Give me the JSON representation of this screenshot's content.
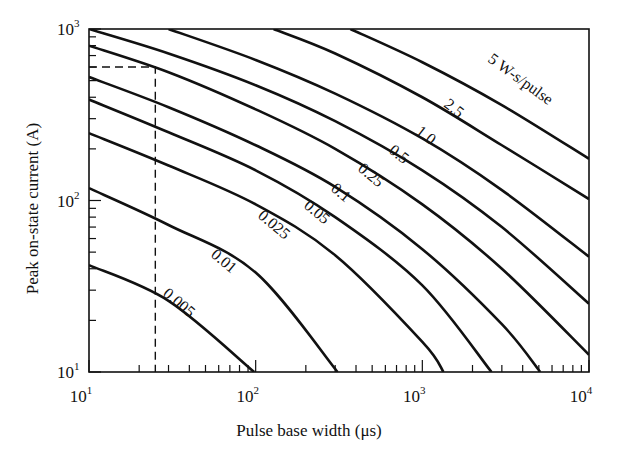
{
  "chart_data": {
    "type": "line",
    "title": "",
    "xlabel": "Pulse base width (μs)",
    "ylabel": "Peak on-state current (A)",
    "xscale": "log",
    "yscale": "log",
    "xlim": [
      10,
      10000
    ],
    "ylim": [
      10,
      1000
    ],
    "grid": false,
    "legend": "inline curve labels",
    "x_ticks": [
      {
        "value": 10,
        "label_base": "10",
        "label_exp": "1"
      },
      {
        "value": 100,
        "label_base": "10",
        "label_exp": "2"
      },
      {
        "value": 1000,
        "label_base": "10",
        "label_exp": "3"
      },
      {
        "value": 10000,
        "label_base": "10",
        "label_exp": "4"
      }
    ],
    "y_ticks": [
      {
        "value": 10,
        "label_base": "10",
        "label_exp": "1"
      },
      {
        "value": 100,
        "label_base": "10",
        "label_exp": "2"
      },
      {
        "value": 1000,
        "label_base": "10",
        "label_exp": "3"
      }
    ],
    "series_unit": "W-s/pulse",
    "series": [
      {
        "name": "5",
        "label": "5 W-s/pulse",
        "points": [
          [
            370,
            1000
          ],
          [
            1000,
            640
          ],
          [
            3000,
            360
          ],
          [
            10000,
            175
          ]
        ]
      },
      {
        "name": "2.5",
        "label": "2.5",
        "points": [
          [
            128,
            1000
          ],
          [
            300,
            720
          ],
          [
            1000,
            400
          ],
          [
            3000,
            210
          ],
          [
            10000,
            102
          ]
        ]
      },
      {
        "name": "1.0",
        "label": "1.0",
        "points": [
          [
            30,
            1000
          ],
          [
            100,
            660
          ],
          [
            300,
            420
          ],
          [
            1000,
            230
          ],
          [
            3000,
            115
          ],
          [
            10000,
            47
          ]
        ]
      },
      {
        "name": "0.5",
        "label": "0.5",
        "points": [
          [
            10,
            1000
          ],
          [
            30,
            720
          ],
          [
            100,
            470
          ],
          [
            300,
            290
          ],
          [
            1000,
            150
          ],
          [
            3000,
            70
          ],
          [
            10000,
            25
          ]
        ]
      },
      {
        "name": "0.25",
        "label": "0.25",
        "points": [
          [
            10,
            800
          ],
          [
            30,
            560
          ],
          [
            100,
            340
          ],
          [
            300,
            200
          ],
          [
            1000,
            95
          ],
          [
            3000,
            40
          ],
          [
            10000,
            12.6
          ]
        ]
      },
      {
        "name": "0.1",
        "label": "0.1",
        "points": [
          [
            10,
            525
          ],
          [
            30,
            350
          ],
          [
            100,
            210
          ],
          [
            300,
            120
          ],
          [
            1000,
            52
          ],
          [
            3000,
            19
          ],
          [
            5100,
            10
          ]
        ]
      },
      {
        "name": "0.05",
        "label": "0.05",
        "points": [
          [
            10,
            388
          ],
          [
            30,
            250
          ],
          [
            100,
            150
          ],
          [
            300,
            80
          ],
          [
            1000,
            32
          ],
          [
            2600,
            10
          ]
        ]
      },
      {
        "name": "0.025",
        "label": "0.025",
        "points": [
          [
            10,
            247
          ],
          [
            30,
            160
          ],
          [
            100,
            95
          ],
          [
            300,
            48
          ],
          [
            1000,
            15
          ],
          [
            1340,
            10
          ]
        ]
      },
      {
        "name": "0.01",
        "label": "0.01",
        "points": [
          [
            10,
            118
          ],
          [
            30,
            72
          ],
          [
            100,
            38
          ],
          [
            310,
            10
          ]
        ]
      },
      {
        "name": "0.005",
        "label": "0.005",
        "points": [
          [
            10,
            42
          ],
          [
            30,
            26
          ],
          [
            98,
            10
          ]
        ]
      }
    ],
    "annotations": [
      {
        "type": "dashed-guide",
        "x": 25,
        "y": 600,
        "description": "dashed vertical at ~25 μs and horizontal at ~600 A"
      }
    ]
  }
}
